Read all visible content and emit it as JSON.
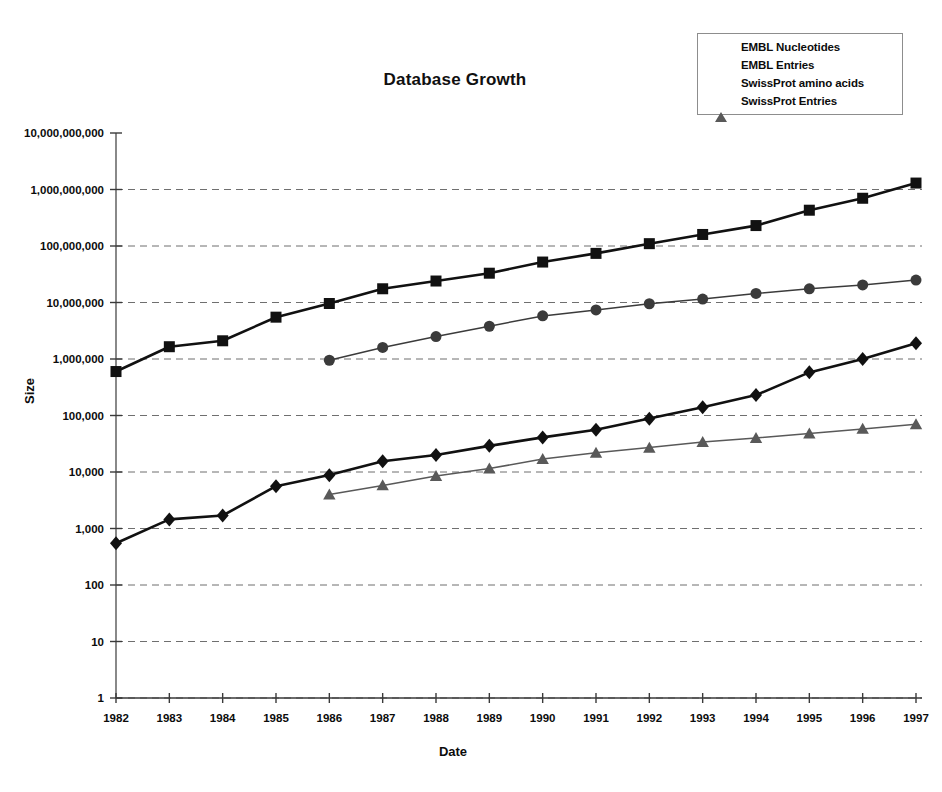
{
  "chart_data": {
    "type": "line",
    "title": "Database Growth",
    "xlabel": "Date",
    "ylabel": "Size",
    "yscale": "log",
    "ylim": [
      1,
      10000000000
    ],
    "grid": true,
    "legend_position": "top-right",
    "categories": [
      "1982",
      "1983",
      "1984",
      "1985",
      "1986",
      "1987",
      "1988",
      "1989",
      "1990",
      "1991",
      "1992",
      "1993",
      "1994",
      "1995",
      "1996",
      "1997"
    ],
    "ytick_labels": [
      "10,000,000,000",
      "1,000,000,000",
      "100,000,000",
      "10,000,000",
      "1,000,000",
      "100,000",
      "10,000",
      "1,000",
      "100",
      "10",
      "1"
    ],
    "ytick_values": [
      10000000000,
      1000000000,
      100000000,
      10000000,
      1000000,
      100000,
      10000,
      1000,
      100,
      10,
      1
    ],
    "series": [
      {
        "name": "EMBL Nucleotides",
        "marker": "square",
        "color": "#111111",
        "x": [
          "1982",
          "1983",
          "1984",
          "1985",
          "1986",
          "1987",
          "1988",
          "1989",
          "1990",
          "1991",
          "1992",
          "1993",
          "1994",
          "1995",
          "1996",
          "1997"
        ],
        "values": [
          600000,
          1650000,
          2100000,
          5500000,
          9600000,
          17500000,
          24000000,
          33000000,
          52000000,
          74000000,
          110000000,
          160000000,
          230000000,
          430000000,
          700000000,
          1300000000
        ]
      },
      {
        "name": "EMBL Entries",
        "marker": "diamond",
        "color": "#111111",
        "x": [
          "1982",
          "1983",
          "1984",
          "1985",
          "1986",
          "1987",
          "1988",
          "1989",
          "1990",
          "1991",
          "1992",
          "1993",
          "1994",
          "1995",
          "1996",
          "1997"
        ],
        "values": [
          550,
          1450,
          1700,
          5600,
          8800,
          15500,
          20000,
          29000,
          41000,
          56000,
          88000,
          140000,
          230000,
          580000,
          1000000,
          1900000
        ]
      },
      {
        "name": "SwissProt amino acids",
        "marker": "circle",
        "color": "#3b3b3b",
        "x": [
          "1986",
          "1987",
          "1988",
          "1989",
          "1990",
          "1991",
          "1992",
          "1993",
          "1994",
          "1995",
          "1996",
          "1997"
        ],
        "values": [
          950000,
          1600000,
          2500000,
          3800000,
          5800000,
          7400000,
          9500000,
          11500000,
          14500000,
          17500000,
          20500000,
          25000000
        ]
      },
      {
        "name": "SwissProt Entries",
        "marker": "triangle",
        "color": "#595959",
        "x": [
          "1986",
          "1987",
          "1988",
          "1989",
          "1990",
          "1991",
          "1992",
          "1993",
          "1994",
          "1995",
          "1996",
          "1997"
        ],
        "values": [
          4000,
          5800,
          8500,
          11500,
          17000,
          22000,
          27000,
          34000,
          40000,
          48000,
          58000,
          70000
        ]
      }
    ]
  },
  "legend": {
    "items": [
      {
        "label": "EMBL Nucleotides",
        "marker": "square",
        "color": "#111111"
      },
      {
        "label": "EMBL Entries",
        "marker": "diamond",
        "color": "#111111"
      },
      {
        "label": "SwissProt amino acids",
        "marker": "circle",
        "color": "#3b3b3b"
      },
      {
        "label": "SwissProt Entries",
        "marker": "triangle",
        "color": "#595959"
      }
    ]
  }
}
